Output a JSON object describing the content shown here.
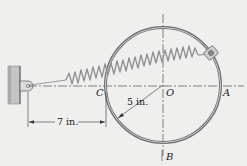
{
  "figure": {
    "type": "mechanics-diagram",
    "labels": {
      "point_C": "C",
      "point_O": "O",
      "point_A": "A",
      "point_B": "B"
    },
    "dimensions": {
      "radius": "5 in.",
      "horizontal_distance": "7 in."
    },
    "colors": {
      "background": "#efefed",
      "ring": "#6e6e6e",
      "ring_inner": "#c9c9c9",
      "spring": "#8a8a8a",
      "wall": "#bdbdbd",
      "text": "#222222",
      "centerline": "#333333"
    }
  }
}
